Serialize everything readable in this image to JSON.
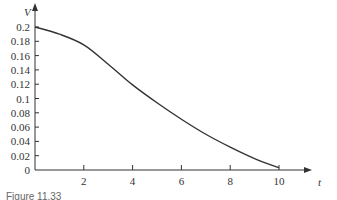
{
  "chart_data": {
    "type": "line",
    "title": "",
    "xlabel": "t",
    "ylabel": "V",
    "xlim": [
      0,
      10.6
    ],
    "ylim": [
      0,
      0.2
    ],
    "x_ticks": [
      2,
      4,
      6,
      8,
      10
    ],
    "x_tick_labels": [
      "2",
      "4",
      "6",
      "8",
      "10"
    ],
    "y_ticks": [
      0,
      0.02,
      0.04,
      0.06,
      0.08,
      0.1,
      0.12,
      0.14,
      0.16,
      0.18,
      0.2
    ],
    "y_tick_labels": [
      "0",
      "0.02",
      "0.04",
      "0.06",
      "0.08",
      "0.1",
      "0.12",
      "0.14",
      "0.16",
      "0.18",
      "0.2"
    ],
    "grid": false,
    "legend": null,
    "series": [
      {
        "name": "V",
        "x": [
          0,
          1,
          2,
          3,
          4,
          5,
          6,
          7,
          8,
          9,
          10
        ],
        "values": [
          0.2,
          0.19,
          0.175,
          0.148,
          0.119,
          0.094,
          0.071,
          0.05,
          0.032,
          0.016,
          0.003
        ]
      }
    ]
  },
  "caption": "Figure 11.33"
}
